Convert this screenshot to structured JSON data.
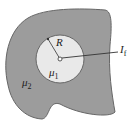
{
  "diagram": {
    "type": "cross-section",
    "outer_region": {
      "label": "μ",
      "subscript": "2",
      "fill": "#9a9a9a"
    },
    "inner_region": {
      "label": "μ",
      "subscript": "1",
      "fill": "#e8e8e8"
    },
    "radius_label": "R",
    "current_label": "I",
    "current_subscript": "f"
  }
}
